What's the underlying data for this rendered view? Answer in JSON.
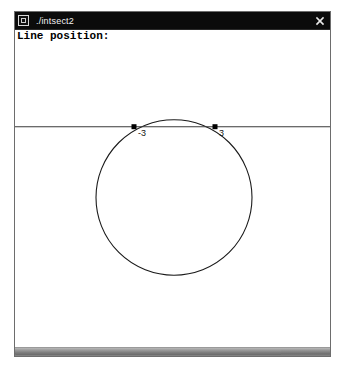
{
  "window": {
    "title": "./intsect2",
    "menu_icon": "window-menu-icon",
    "close_icon": "close-icon",
    "close_label": "×"
  },
  "client": {
    "prompt_label": "Line position:"
  },
  "scrollbar": {
    "orientation": "horizontal"
  },
  "chart_data": {
    "type": "scatter",
    "title": "",
    "xlabel": "",
    "ylabel": "",
    "grid": false,
    "legend": null,
    "shapes": [
      {
        "name": "circle",
        "kind": "circle",
        "cx": 159,
        "cy": 168,
        "r": 78,
        "stroke": "#1a1a1a",
        "stroke_width": 1.1,
        "fill": "none"
      },
      {
        "name": "horizontal-line",
        "kind": "line",
        "x1": 0,
        "y1": 97,
        "x2": 315,
        "y2": 97,
        "stroke": "#3a3a3a",
        "stroke_width": 1.1
      }
    ],
    "points": [
      {
        "name": "left-intersection",
        "x": 119,
        "y": 97,
        "label": "-3",
        "label_dx": 4,
        "label_dy": 9
      },
      {
        "name": "right-intersection",
        "x": 200,
        "y": 97,
        "label": "3",
        "label_dx": 4,
        "label_dy": 9
      }
    ],
    "marker": {
      "shape": "square",
      "size": 5,
      "color": "#000000"
    },
    "label_color": "#111111",
    "label_font_size": 9
  }
}
